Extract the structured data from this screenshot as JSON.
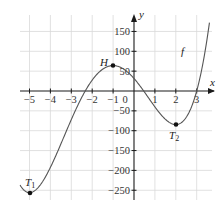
{
  "chart_data": {
    "type": "line",
    "title": "",
    "xlabel": "x",
    "ylabel": "y",
    "xlim": [
      -5.5,
      3.7
    ],
    "ylim": [
      -270,
      175
    ],
    "grid": true,
    "x_ticks": [
      -5,
      -4,
      -3,
      -2,
      -1,
      0,
      1,
      2,
      3
    ],
    "x_tick_labels": [
      "−5",
      "−4",
      "−3",
      "−2",
      "−1",
      "0",
      "1",
      "2",
      "3"
    ],
    "y_ticks": [
      150,
      100,
      50,
      -50,
      -100,
      -150,
      -200,
      -250
    ],
    "y_tick_labels": [
      "150",
      "100",
      "50",
      "−50",
      "−100",
      "−150",
      "−200",
      "−250"
    ],
    "series": [
      {
        "name": "f",
        "function": "1.5x^4 + 8x^3 - 21x^2 - 60x + 31.5",
        "x": [
          -5.4,
          -5,
          -4,
          -3,
          -2.4,
          -2,
          -1,
          0,
          0.5,
          1,
          2,
          3,
          3.5
        ],
        "y": [
          -241,
          -256,
          -145,
          -17,
          33,
          51,
          64,
          31.5,
          0,
          -40,
          -85,
          4,
          132
        ]
      }
    ],
    "annotations": [
      {
        "label": "T1",
        "x": -5,
        "y": -256,
        "type": "minimum"
      },
      {
        "label": "H",
        "x": -1,
        "y": 64,
        "type": "maximum"
      },
      {
        "label": "T2",
        "x": 2,
        "y": -85,
        "type": "minimum"
      },
      {
        "label": "f",
        "x": 2.6,
        "y": 100,
        "type": "curve-label"
      }
    ]
  },
  "labels": {
    "x_axis": "x",
    "y_axis": "y",
    "curve": "f",
    "T1": "T",
    "T1_sub": "1",
    "H": "H",
    "T2": "T",
    "T2_sub": "2",
    "origin": "0"
  }
}
